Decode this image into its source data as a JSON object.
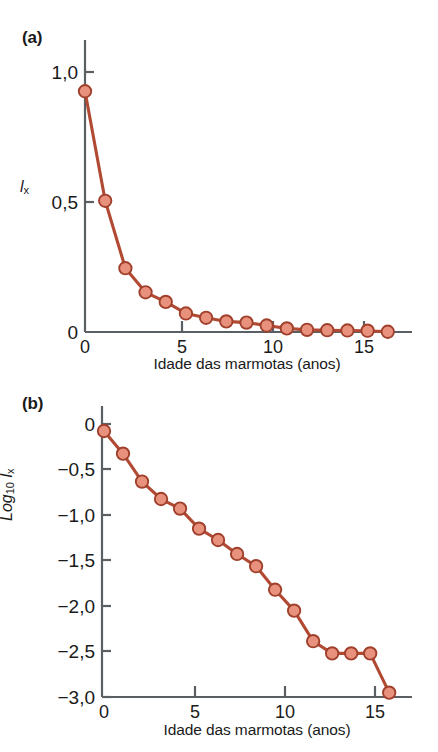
{
  "figure": {
    "background_color": "#ffffff",
    "marker_fill": "#e8917c",
    "marker_stroke": "#a0402c",
    "line_color": "#b24a33",
    "axis_color": "#5a5f63",
    "text_color": "#1a1a1a"
  },
  "panels": [
    {
      "id": "a",
      "label": "(a)",
      "ylabel_main": "l",
      "ylabel_sub": "x",
      "xlabel": "Idade das marmotas (anos)",
      "ytick_labels": [
        "1,0",
        "0,5",
        "0"
      ],
      "xtick_labels": [
        "0",
        "5",
        "10",
        "15"
      ]
    },
    {
      "id": "b",
      "label": "(b)",
      "ylabel_log": "Log",
      "ylabel_log_sub": "10",
      "ylabel_main": "l",
      "ylabel_sub": "x",
      "xlabel": "Idade das marmotas (anos)",
      "ytick_labels": [
        "0",
        "−0,5",
        "−1,0",
        "−1,5",
        "−2,0",
        "−2,5",
        "−3,0"
      ],
      "xtick_labels": [
        "0",
        "5",
        "10",
        "15"
      ]
    }
  ],
  "chart_data": [
    {
      "type": "line",
      "panel": "a",
      "title": "",
      "xlabel": "Idade das marmotas (anos)",
      "ylabel": "lx",
      "xlim": [
        0,
        16.2
      ],
      "ylim": [
        0,
        1.08
      ],
      "xticks": [
        0,
        5,
        10,
        15
      ],
      "yticks": [
        0,
        0.5,
        1.0
      ],
      "xtick_labels": [
        "0",
        "5",
        "10",
        "15"
      ],
      "ytick_labels": [
        "0",
        "0,5",
        "1,0"
      ],
      "grid": false,
      "legend": false,
      "markers": true,
      "x": [
        0,
        1,
        2,
        3,
        4,
        5,
        6,
        7,
        8,
        9,
        10,
        11,
        12,
        13,
        14,
        15
      ],
      "values": [
        1.0,
        0.545,
        0.265,
        0.165,
        0.125,
        0.077,
        0.059,
        0.044,
        0.039,
        0.027,
        0.015,
        0.009,
        0.0075,
        0.0065,
        0.0055,
        0.001
      ]
    },
    {
      "type": "line",
      "panel": "b",
      "title": "",
      "xlabel": "Idade das marmotas (anos)",
      "ylabel": "Log10 lx",
      "xlim": [
        0,
        16.2
      ],
      "ylim": [
        -3.05,
        0.08
      ],
      "xticks": [
        0,
        5,
        10,
        15
      ],
      "yticks": [
        0,
        -0.5,
        -1.0,
        -1.5,
        -2.0,
        -2.5,
        -3.0
      ],
      "xtick_labels": [
        "0",
        "5",
        "10",
        "15"
      ],
      "ytick_labels": [
        "0",
        "−0,5",
        "−1,0",
        "−1,5",
        "−2,0",
        "−2,5",
        "−3,0"
      ],
      "grid": false,
      "legend": false,
      "markers": true,
      "x": [
        0,
        1,
        2,
        3,
        4,
        5,
        6,
        7,
        8,
        9,
        10,
        11,
        12,
        13,
        14,
        15
      ],
      "values": [
        0.0,
        -0.26,
        -0.58,
        -0.78,
        -0.89,
        -1.12,
        -1.25,
        -1.41,
        -1.55,
        -1.82,
        -2.06,
        -2.41,
        -2.55,
        -2.55,
        -2.55,
        -3.0
      ]
    }
  ]
}
